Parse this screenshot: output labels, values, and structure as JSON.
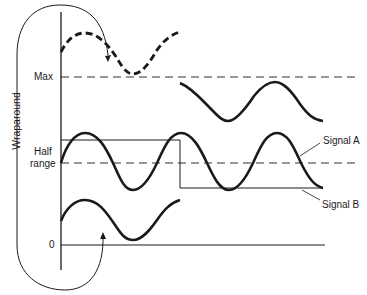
{
  "diagram": {
    "wraparound_label": "Wraparound",
    "y_labels": {
      "max": "Max",
      "half_line1": "Half",
      "half_line2": "range",
      "zero": "0"
    },
    "signals": {
      "a": "Signal A",
      "b": "Signal B"
    },
    "colors": {
      "ink": "#1a1a1a",
      "background": "#ffffff"
    }
  }
}
